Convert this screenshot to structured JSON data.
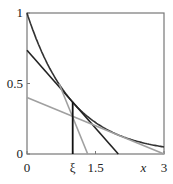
{
  "chart_data": {
    "type": "line",
    "title": "",
    "xlabel": "x",
    "ylabel": "",
    "xlim": [
      0,
      3
    ],
    "ylim": [
      0,
      1
    ],
    "xticks": [
      {
        "v": 0,
        "label": "0"
      },
      {
        "v": 1.0,
        "label": "ξ"
      },
      {
        "v": 1.5,
        "label": "1.5"
      },
      {
        "v": 3,
        "label": "3"
      }
    ],
    "yticks": [
      {
        "v": 0,
        "label": "0"
      },
      {
        "v": 0.5,
        "label": "0.5"
      },
      {
        "v": 1,
        "label": "1"
      }
    ],
    "grid": false,
    "series": [
      {
        "name": "exp(-x) curve",
        "color": "#333333",
        "kind": "function"
      },
      {
        "name": "tangent at xi",
        "color": "#222222",
        "points": [
          [
            0,
            0.736
          ],
          [
            2.0,
            0
          ]
        ]
      },
      {
        "name": "steep gray line",
        "color": "#a0a0a0",
        "points": [
          [
            0.7,
            0.5
          ],
          [
            1.33,
            0
          ]
        ]
      },
      {
        "name": "shallow gray line",
        "color": "#a0a0a0",
        "points": [
          [
            0,
            0.4
          ],
          [
            3,
            0
          ]
        ]
      },
      {
        "name": "xi marker",
        "color": "#111111",
        "points": [
          [
            1.0,
            0
          ],
          [
            1.0,
            0.368
          ]
        ]
      }
    ]
  }
}
